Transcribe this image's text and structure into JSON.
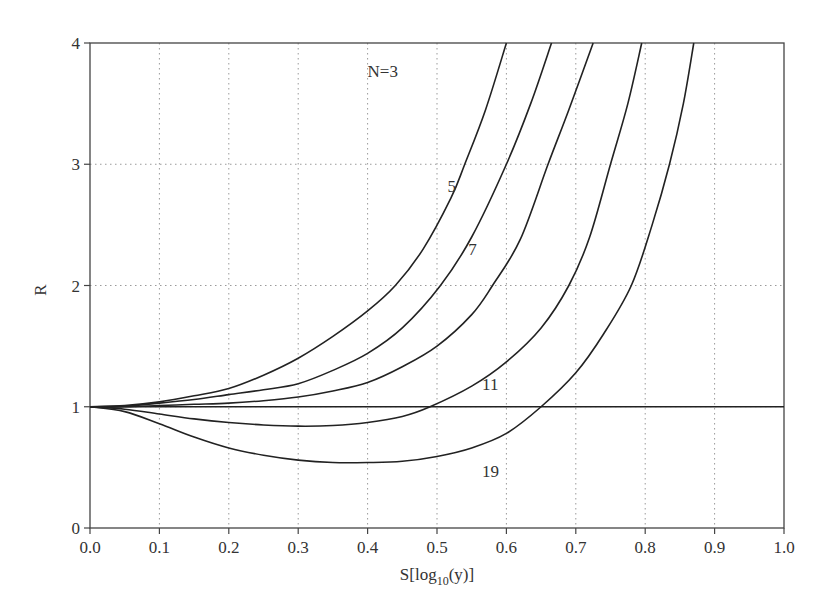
{
  "chart_data": {
    "type": "line",
    "title": "",
    "xlabel": "S[log10(y)]",
    "xlabel_main": "S[log",
    "xlabel_sub": "10",
    "xlabel_tail": "(y)]",
    "ylabel": "R",
    "xlim": [
      0.0,
      1.0
    ],
    "ylim": [
      0,
      4
    ],
    "grid": true,
    "legend": "inline labels",
    "x_ticks": [
      "0.0",
      "0.1",
      "0.2",
      "0.3",
      "0.4",
      "0.5",
      "0.6",
      "0.7",
      "0.8",
      "0.9",
      "1.0"
    ],
    "y_ticks": [
      "0",
      "1",
      "2",
      "3",
      "4"
    ],
    "reference_line": {
      "name": "R=1",
      "y": 1
    },
    "series": [
      {
        "name": "N=3",
        "label": "N=3",
        "label_pos": [
          0.4,
          3.72
        ],
        "x": [
          0.0,
          0.05,
          0.1,
          0.15,
          0.2,
          0.25,
          0.3,
          0.35,
          0.4,
          0.44,
          0.48,
          0.52,
          0.54,
          0.57,
          0.6
        ],
        "y": [
          1.0,
          1.01,
          1.04,
          1.09,
          1.15,
          1.26,
          1.4,
          1.58,
          1.79,
          2.0,
          2.3,
          2.72,
          3.0,
          3.45,
          4.0
        ]
      },
      {
        "name": "N=5",
        "label": "5",
        "label_pos": [
          0.515,
          2.77
        ],
        "x": [
          0.0,
          0.05,
          0.1,
          0.15,
          0.2,
          0.25,
          0.3,
          0.35,
          0.4,
          0.45,
          0.505,
          0.55,
          0.6,
          0.635,
          0.665
        ],
        "y": [
          1.0,
          1.005,
          1.03,
          1.06,
          1.1,
          1.14,
          1.19,
          1.3,
          1.44,
          1.65,
          2.0,
          2.4,
          3.0,
          3.5,
          4.0
        ]
      },
      {
        "name": "N=7",
        "label": "7",
        "label_pos": [
          0.545,
          2.25
        ],
        "x": [
          0.0,
          0.05,
          0.1,
          0.15,
          0.2,
          0.25,
          0.3,
          0.35,
          0.4,
          0.45,
          0.5,
          0.55,
          0.58,
          0.62,
          0.66,
          0.69,
          0.725
        ],
        "y": [
          1.0,
          1.0,
          1.01,
          1.02,
          1.03,
          1.05,
          1.08,
          1.13,
          1.2,
          1.33,
          1.5,
          1.76,
          2.0,
          2.38,
          3.0,
          3.45,
          4.0
        ]
      },
      {
        "name": "N=11",
        "label": "11",
        "label_pos": [
          0.565,
          1.14
        ],
        "x": [
          0.0,
          0.05,
          0.1,
          0.15,
          0.2,
          0.25,
          0.3,
          0.35,
          0.4,
          0.45,
          0.49,
          0.55,
          0.6,
          0.65,
          0.69,
          0.72,
          0.75,
          0.775,
          0.795
        ],
        "y": [
          1.0,
          0.98,
          0.94,
          0.9,
          0.87,
          0.85,
          0.84,
          0.845,
          0.87,
          0.92,
          1.0,
          1.17,
          1.37,
          1.65,
          2.0,
          2.4,
          3.0,
          3.5,
          4.0
        ]
      },
      {
        "name": "N=19",
        "label": "19",
        "label_pos": [
          0.565,
          0.42
        ],
        "x": [
          0.0,
          0.05,
          0.1,
          0.15,
          0.2,
          0.25,
          0.3,
          0.35,
          0.4,
          0.45,
          0.5,
          0.55,
          0.6,
          0.65,
          0.7,
          0.74,
          0.78,
          0.81,
          0.835,
          0.855,
          0.87
        ],
        "y": [
          1.0,
          0.96,
          0.86,
          0.75,
          0.66,
          0.6,
          0.56,
          0.54,
          0.54,
          0.55,
          0.59,
          0.66,
          0.78,
          1.0,
          1.28,
          1.6,
          2.0,
          2.5,
          3.0,
          3.5,
          4.0
        ]
      }
    ],
    "colors": {
      "line": "#222222",
      "grid": "#9a9a9a",
      "axis": "#444444",
      "text": "#333333"
    }
  }
}
